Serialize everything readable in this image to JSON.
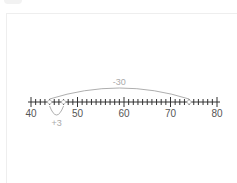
{
  "diagram": {
    "type": "number-line",
    "min": 40,
    "max": 80,
    "major_step": 10,
    "minor_step": 1,
    "major_labels": [
      "40",
      "50",
      "60",
      "70",
      "80"
    ],
    "markers": [
      44,
      47,
      74
    ],
    "jumps": [
      {
        "from": 74,
        "to": 44,
        "label": "-30",
        "position": "above"
      },
      {
        "from": 44,
        "to": 47,
        "label": "+3",
        "position": "below"
      }
    ]
  },
  "colors": {
    "line": "#333333",
    "arc": "#999999",
    "arc_label": "#aaaaaa",
    "marker": "#bbbbbb"
  }
}
